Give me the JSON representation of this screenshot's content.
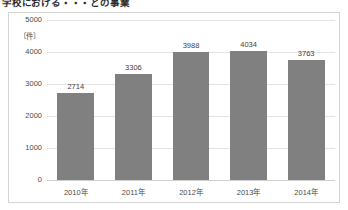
{
  "page": {
    "title": "学校における・・・との事業"
  },
  "chart_data": {
    "type": "bar",
    "title": "",
    "xlabel": "",
    "ylabel": "",
    "unit_label": "〔件〕",
    "categories": [
      "2010年",
      "2011年",
      "2012年",
      "2013年",
      "2014年"
    ],
    "values": [
      2714,
      3306,
      3988,
      4034,
      3763
    ],
    "value_labels": [
      "2714",
      "3306",
      "3988",
      "4034",
      "3763"
    ],
    "ylim": [
      0,
      5000
    ],
    "yticks": [
      5000,
      4000,
      3000,
      2000,
      1000,
      0
    ],
    "ytick_labels": [
      "5000",
      "4000",
      "3000",
      "2000",
      "1000",
      "0"
    ],
    "grid": true,
    "legend": false,
    "bar_color": "#808080",
    "gridline_color": "#e3e3e3",
    "frame_color": "#d4d4d4"
  }
}
